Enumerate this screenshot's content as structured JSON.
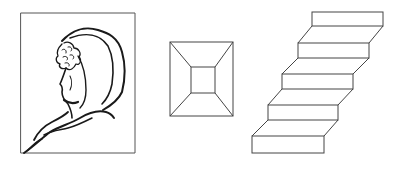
{
  "figure": {
    "panels": [
      {
        "id": "ambiguous-face",
        "description": "Ambiguous line drawing: old woman / young woman face in a hooded shawl inside a rectangular frame"
      },
      {
        "id": "reversible-box",
        "description": "Reversible perspective square frustum (truncated pyramid / corridor)"
      },
      {
        "id": "schroeder-staircase",
        "description": "Reversible staircase with five steps"
      }
    ],
    "colors": {
      "stroke": "#1a1a1a",
      "thin_stroke": "#555555",
      "background": "#ffffff"
    },
    "staircase_steps": 5
  }
}
